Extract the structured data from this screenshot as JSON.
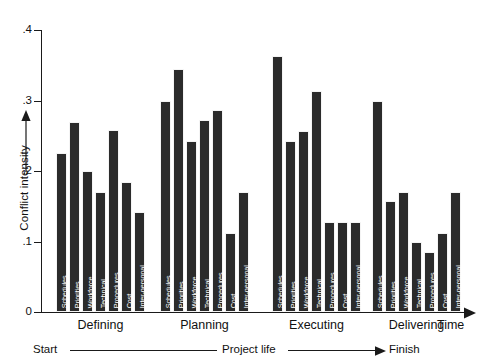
{
  "chart_data": {
    "type": "bar",
    "title": "",
    "xlabel": "Time",
    "ylabel": "Conflict intensity",
    "ylim": [
      0,
      0.4
    ],
    "ytick_labels": [
      "0",
      ".1",
      ".2",
      ".3",
      ".4"
    ],
    "ytick_values": [
      0,
      0.1,
      0.2,
      0.3,
      0.4
    ],
    "grid": false,
    "legend": "none",
    "categories": [
      "Schedules",
      "Priorities",
      "Workforce",
      "Technical",
      "Procedures",
      "Cost",
      "Inter-personal"
    ],
    "groups": [
      "Defining",
      "Planning",
      "Executing",
      "Delivering"
    ],
    "series": [
      {
        "name": "Defining",
        "values": [
          0.225,
          0.27,
          0.2,
          0.17,
          0.258,
          0.185,
          0.142
        ]
      },
      {
        "name": "Planning",
        "values": [
          0.3,
          0.345,
          0.242,
          0.272,
          0.287,
          0.112,
          0.17
        ]
      },
      {
        "name": "Executing",
        "values": [
          0.363,
          0.242,
          0.257,
          0.313,
          0.127,
          0.127,
          0.127
        ]
      },
      {
        "name": "Delivering",
        "values": [
          0.3,
          0.157,
          0.17,
          0.1,
          0.085,
          0.112,
          0.17
        ]
      }
    ],
    "annotations": {
      "timeline_start": "Start",
      "timeline_middle": "Project life",
      "timeline_finish": "Finish"
    },
    "bar_color": "#2b2b2b",
    "axis_color": "#1a1a1a"
  },
  "axis": {
    "y_label": "Conflict intensity",
    "x_label": "Time",
    "y_ticks": [
      {
        "label": ".4",
        "value": 0.4
      },
      {
        "label": ".3",
        "value": 0.3
      },
      {
        "label": ".2",
        "value": 0.2
      },
      {
        "label": ".1",
        "value": 0.1
      },
      {
        "label": "0",
        "value": 0.0
      }
    ]
  },
  "phases": [
    {
      "label": "Defining"
    },
    {
      "label": "Planning"
    },
    {
      "label": "Executing"
    },
    {
      "label": "Delivering"
    }
  ],
  "timeline": {
    "start": "Start",
    "middle": "Project life",
    "finish": "Finish"
  }
}
